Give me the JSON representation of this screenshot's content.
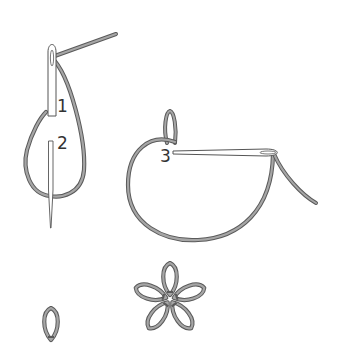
{
  "diagram": {
    "type": "embroidery-stitch-instructions",
    "stitch": "lazy daisy",
    "colors": {
      "background": "#ffffff",
      "thread": "#8f8f8f",
      "thread_outline": "#5a5a5a",
      "needle_fill": "#ffffff",
      "needle_outline": "#555555",
      "label": "#333333"
    },
    "steps": [
      {
        "id": "step-1",
        "label": "1"
      },
      {
        "id": "step-2",
        "label": "2"
      },
      {
        "id": "step-3",
        "label": "3"
      }
    ],
    "results": [
      {
        "id": "single-petal",
        "name": "single lazy daisy loop"
      },
      {
        "id": "flower",
        "name": "five-petal flower",
        "petal_count": 5
      }
    ]
  }
}
